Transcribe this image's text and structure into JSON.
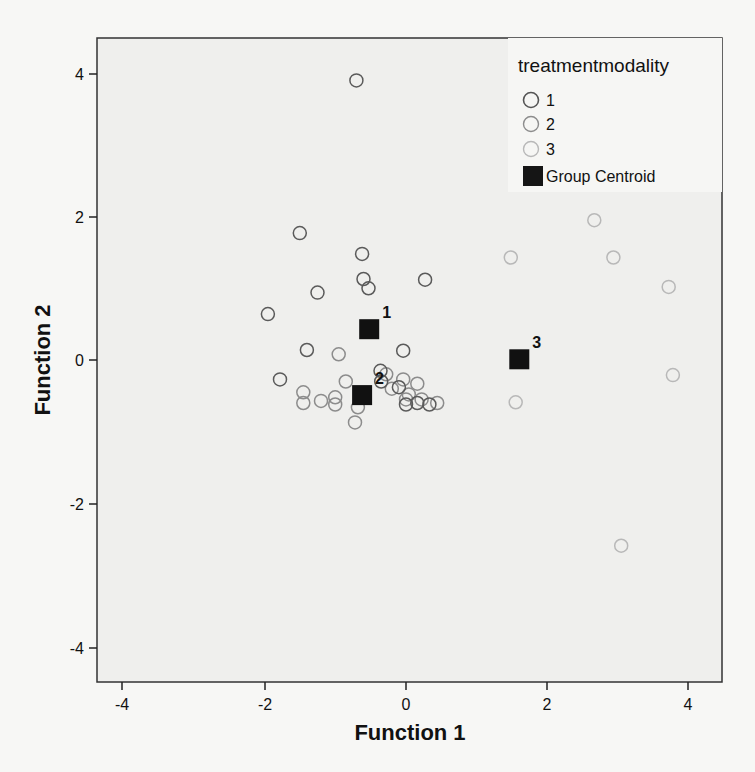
{
  "chart_data": {
    "type": "scatter",
    "title": "",
    "xlabel": "Function 1",
    "ylabel": "Function 2",
    "xlim": [
      -4.4,
      4.4
    ],
    "ylim": [
      -4.5,
      4.5
    ],
    "xticks": [
      -4,
      -2,
      0,
      2,
      4
    ],
    "yticks": [
      -4,
      -2,
      0,
      2,
      4
    ],
    "grid": false,
    "legend": {
      "title": "treatmentmodality",
      "position": "top-right",
      "entries": [
        {
          "label": "1",
          "marker": "open-circle",
          "color": "#555555"
        },
        {
          "label": "2",
          "marker": "open-circle",
          "color": "#8c8c8c"
        },
        {
          "label": "3",
          "marker": "open-circle",
          "color": "#b5b5b5"
        },
        {
          "label": "Group Centroid",
          "marker": "filled-square",
          "color": "#111111"
        }
      ]
    },
    "series": [
      {
        "name": "1",
        "color": "#5a5a5a",
        "points": [
          [
            -0.7,
            3.9
          ],
          [
            -1.5,
            1.77
          ],
          [
            -0.62,
            1.48
          ],
          [
            -0.6,
            1.13
          ],
          [
            -0.53,
            1.0
          ],
          [
            -1.25,
            0.94
          ],
          [
            -1.95,
            0.64
          ],
          [
            0.27,
            1.12
          ],
          [
            -1.4,
            0.14
          ],
          [
            -0.04,
            0.13
          ],
          [
            -1.78,
            -0.27
          ],
          [
            -0.36,
            -0.15
          ],
          [
            -0.35,
            -0.3
          ],
          [
            0.0,
            -0.62
          ],
          [
            0.16,
            -0.6
          ],
          [
            0.33,
            -0.62
          ],
          [
            -0.1,
            -0.38
          ]
        ]
      },
      {
        "name": "2",
        "color": "#8c8c8c",
        "points": [
          [
            -0.95,
            0.08
          ],
          [
            -1.45,
            -0.45
          ],
          [
            -1.45,
            -0.6
          ],
          [
            -1.2,
            -0.57
          ],
          [
            -1.0,
            -0.62
          ],
          [
            -1.0,
            -0.52
          ],
          [
            -0.68,
            -0.66
          ],
          [
            -0.72,
            -0.87
          ],
          [
            -0.28,
            -0.2
          ],
          [
            -0.04,
            -0.27
          ],
          [
            0.16,
            -0.33
          ],
          [
            0.04,
            -0.48
          ],
          [
            0.0,
            -0.55
          ],
          [
            0.44,
            -0.6
          ],
          [
            -0.2,
            -0.4
          ],
          [
            0.22,
            -0.55
          ],
          [
            -0.85,
            -0.3
          ]
        ]
      },
      {
        "name": "3",
        "color": "#b8b8b8",
        "points": [
          [
            2.66,
            1.95
          ],
          [
            1.48,
            1.43
          ],
          [
            2.93,
            1.43
          ],
          [
            3.71,
            1.02
          ],
          [
            3.77,
            -0.21
          ],
          [
            1.55,
            -0.59
          ],
          [
            3.04,
            -2.59
          ]
        ]
      },
      {
        "name": "Group Centroid",
        "color": "#111111",
        "points": [
          {
            "group": "1",
            "x": -0.52,
            "y": 0.43
          },
          {
            "group": "2",
            "x": -0.62,
            "y": -0.49
          },
          {
            "group": "3",
            "x": 1.6,
            "y": 0.01
          }
        ]
      }
    ]
  },
  "axes": {
    "x_title": "Function 1",
    "y_title": "Function 2",
    "x_tick_labels": [
      "-4",
      "-2",
      "0",
      "2",
      "4"
    ],
    "y_tick_labels": [
      "4",
      "2",
      "0",
      "-2",
      "-4"
    ]
  },
  "legend": {
    "title": "treatmentmodality",
    "items": [
      "1",
      "2",
      "3",
      "Group Centroid"
    ]
  },
  "centroid_labels": [
    "1",
    "2",
    "3"
  ]
}
